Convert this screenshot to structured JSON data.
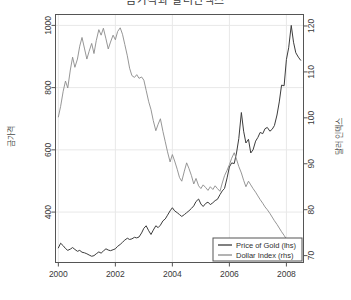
{
  "figure": {
    "width": 351,
    "height": 300,
    "background": "#ffffff",
    "title": "금가격과 달러인덱스"
  },
  "chart_data": {
    "type": "line",
    "title": "금가격과 달러인덱스",
    "xlabel": "",
    "ylabel": "금가격",
    "ylabel_right": "달러 인덱스",
    "grid": true,
    "legend_position": "bottom-right",
    "xlim": [
      1999.9,
      2008.6
    ],
    "xticks": [
      2000,
      2002,
      2004,
      2006,
      2008
    ],
    "xtick_labels": [
      "2000",
      "2002",
      "2004",
      "2006",
      "2008"
    ],
    "ylim": [
      238,
      1035
    ],
    "yticks": [
      400,
      600,
      800,
      1000
    ],
    "ytick_labels": [
      "400",
      "600",
      "800",
      "1000"
    ],
    "ylim_right": [
      68.5,
      122.5
    ],
    "yticks_right": [
      70,
      80,
      90,
      100,
      110,
      120
    ],
    "ytick_labels_right": [
      "70",
      "80",
      "90",
      "100",
      "110",
      "120"
    ],
    "series": [
      {
        "name": "Price of Gold (lhs)",
        "axis": "left",
        "color": "#3c3c3c",
        "x": [
          2000.0,
          2000.08,
          2000.17,
          2000.25,
          2000.33,
          2000.42,
          2000.5,
          2000.58,
          2000.67,
          2000.75,
          2000.83,
          2000.92,
          2001.0,
          2001.08,
          2001.17,
          2001.25,
          2001.33,
          2001.42,
          2001.5,
          2001.58,
          2001.67,
          2001.75,
          2001.83,
          2001.92,
          2002.0,
          2002.08,
          2002.17,
          2002.25,
          2002.33,
          2002.42,
          2002.5,
          2002.58,
          2002.67,
          2002.75,
          2002.83,
          2002.92,
          2003.0,
          2003.08,
          2003.17,
          2003.25,
          2003.33,
          2003.42,
          2003.5,
          2003.58,
          2003.67,
          2003.75,
          2003.83,
          2003.92,
          2004.0,
          2004.08,
          2004.17,
          2004.25,
          2004.33,
          2004.42,
          2004.5,
          2004.58,
          2004.67,
          2004.75,
          2004.83,
          2004.92,
          2005.0,
          2005.08,
          2005.17,
          2005.25,
          2005.33,
          2005.42,
          2005.5,
          2005.58,
          2005.67,
          2005.75,
          2005.83,
          2005.92,
          2006.0,
          2006.08,
          2006.17,
          2006.25,
          2006.33,
          2006.42,
          2006.5,
          2006.58,
          2006.67,
          2006.75,
          2006.83,
          2006.92,
          2007.0,
          2007.08,
          2007.17,
          2007.25,
          2007.33,
          2007.42,
          2007.5,
          2007.58,
          2007.67,
          2007.75,
          2007.83,
          2007.92,
          2008.0,
          2008.08,
          2008.17,
          2008.25,
          2008.33,
          2008.42,
          2008.5
        ],
        "values": [
          285,
          300,
          292,
          283,
          277,
          281,
          286,
          280,
          274,
          277,
          271,
          269,
          266,
          262,
          258,
          260,
          266,
          272,
          268,
          275,
          282,
          278,
          276,
          279,
          282,
          290,
          296,
          303,
          310,
          316,
          312,
          314,
          319,
          317,
          320,
          333,
          348,
          356,
          340,
          328,
          342,
          356,
          350,
          358,
          372,
          378,
          390,
          404,
          414,
          404,
          398,
          392,
          386,
          392,
          398,
          404,
          412,
          420,
          434,
          442,
          426,
          418,
          428,
          432,
          424,
          430,
          437,
          441,
          456,
          468,
          476,
          510,
          545,
          558,
          556,
          590,
          636,
          720,
          660,
          622,
          634,
          590,
          600,
          628,
          640,
          656,
          652,
          668,
          672,
          660,
          666,
          678,
          712,
          754,
          808,
          806,
          890,
          928,
          1000,
          946,
          912,
          898,
          888
        ]
      },
      {
        "name": "Dollar Index (rhs)",
        "axis": "right",
        "color": "#8a8a8a",
        "x": [
          2000.0,
          2000.08,
          2000.17,
          2000.25,
          2000.33,
          2000.42,
          2000.5,
          2000.58,
          2000.67,
          2000.75,
          2000.83,
          2000.92,
          2001.0,
          2001.08,
          2001.17,
          2001.25,
          2001.33,
          2001.42,
          2001.5,
          2001.58,
          2001.67,
          2001.75,
          2001.83,
          2001.92,
          2002.0,
          2002.08,
          2002.17,
          2002.25,
          2002.33,
          2002.42,
          2002.5,
          2002.58,
          2002.67,
          2002.75,
          2002.83,
          2002.92,
          2003.0,
          2003.08,
          2003.17,
          2003.25,
          2003.33,
          2003.42,
          2003.5,
          2003.58,
          2003.67,
          2003.75,
          2003.83,
          2003.92,
          2004.0,
          2004.08,
          2004.17,
          2004.25,
          2004.33,
          2004.42,
          2004.5,
          2004.58,
          2004.67,
          2004.75,
          2004.83,
          2004.92,
          2005.0,
          2005.08,
          2005.17,
          2005.25,
          2005.33,
          2005.42,
          2005.5,
          2005.58,
          2005.67,
          2005.75,
          2005.83,
          2005.92,
          2006.0,
          2006.08,
          2006.17,
          2006.25,
          2006.33,
          2006.42,
          2006.5,
          2006.58,
          2006.67,
          2006.75,
          2006.83,
          2006.92,
          2007.0,
          2007.08,
          2007.17,
          2007.25,
          2007.33,
          2007.42,
          2007.5,
          2007.58,
          2007.67,
          2007.75,
          2007.83,
          2007.92,
          2008.0,
          2008.08,
          2008.17,
          2008.25,
          2008.33,
          2008.42,
          2008.5
        ],
        "values": [
          100.2,
          102.5,
          105.8,
          108.0,
          106.5,
          110.4,
          113.2,
          111.0,
          112.8,
          115.6,
          117.5,
          115.0,
          112.8,
          114.5,
          116.2,
          114.0,
          116.8,
          119.2,
          118.0,
          119.5,
          117.2,
          115.0,
          116.5,
          118.0,
          117.0,
          118.8,
          119.6,
          118.2,
          116.0,
          113.5,
          110.8,
          109.2,
          108.8,
          109.4,
          108.6,
          108.9,
          108.2,
          106.0,
          103.5,
          101.8,
          99.4,
          97.2,
          98.6,
          99.8,
          97.0,
          94.8,
          92.6,
          90.4,
          92.0,
          90.6,
          88.8,
          87.0,
          86.2,
          88.4,
          90.2,
          89.0,
          87.4,
          85.6,
          86.8,
          85.2,
          84.6,
          85.4,
          84.8,
          84.2,
          85.0,
          84.4,
          85.2,
          84.6,
          84.0,
          85.8,
          87.4,
          88.6,
          89.8,
          91.2,
          92.4,
          91.0,
          89.4,
          88.0,
          86.4,
          85.0,
          86.2,
          85.4,
          84.6,
          83.8,
          83.0,
          82.2,
          81.4,
          80.6,
          80.0,
          79.2,
          78.4,
          77.6,
          76.8,
          76.0,
          75.2,
          74.4,
          73.6,
          73.0,
          72.4,
          73.2,
          72.8,
          73.4,
          73.0
        ]
      }
    ]
  },
  "legend": {
    "entries": [
      {
        "label": "Price of Gold (lhs)",
        "color": "#3c3c3c"
      },
      {
        "label": "Dollar Index (rhs)",
        "color": "#8a8a8a"
      }
    ]
  },
  "axis_titles": {
    "left": "금가격",
    "right": "달러 인덱스"
  }
}
